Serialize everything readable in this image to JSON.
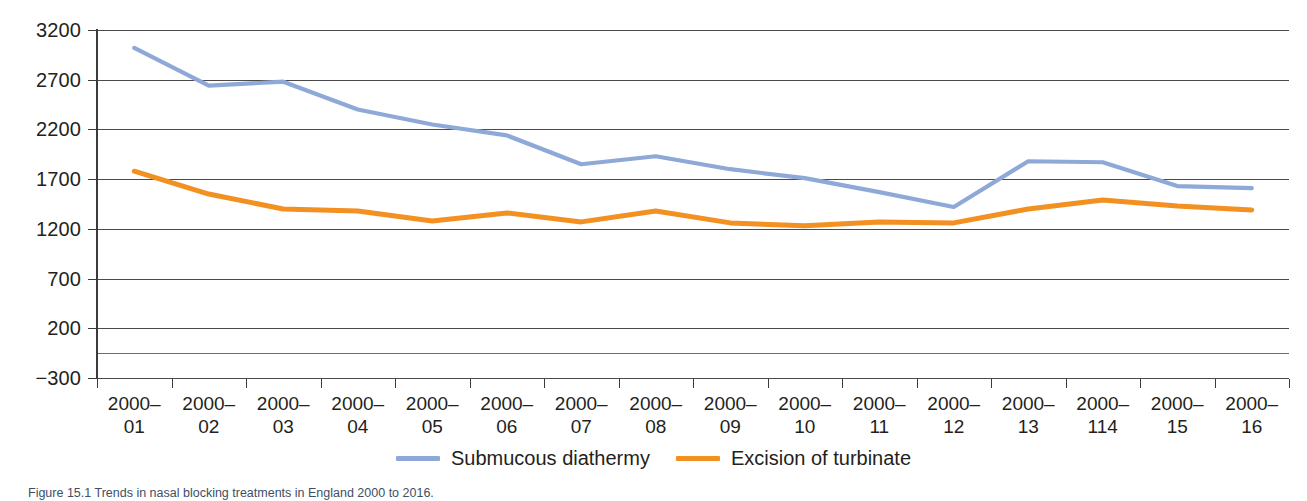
{
  "chart_data": {
    "type": "line",
    "title": "",
    "subtitle": "",
    "xlabel": "",
    "ylabel": "",
    "grid": true,
    "legend_position": "bottom-center",
    "ylim": [
      -300,
      3200
    ],
    "yticks": [
      3200,
      2700,
      2200,
      1700,
      1200,
      700,
      200,
      -300
    ],
    "ytick_labels": [
      "3200",
      "2700",
      "2200",
      "1700",
      "1200",
      "700",
      "200",
      "−300"
    ],
    "extra_gridlines": [
      -50
    ],
    "categories": [
      "2000–01",
      "2000–02",
      "2000–03",
      "2000–04",
      "2000–05",
      "2000–06",
      "2000–07",
      "2000–08",
      "2000–09",
      "2000–10",
      "2000–11",
      "2000–12",
      "2000–13",
      "2000–114",
      "2000–15",
      "2000–16"
    ],
    "category_lines": [
      [
        "2000–",
        "01"
      ],
      [
        "2000–",
        "02"
      ],
      [
        "2000–",
        "03"
      ],
      [
        "2000–",
        "04"
      ],
      [
        "2000–",
        "05"
      ],
      [
        "2000–",
        "06"
      ],
      [
        "2000–",
        "07"
      ],
      [
        "2000–",
        "08"
      ],
      [
        "2000–",
        "09"
      ],
      [
        "2000–",
        "10"
      ],
      [
        "2000–",
        "11"
      ],
      [
        "2000–",
        "12"
      ],
      [
        "2000–",
        "13"
      ],
      [
        "2000–",
        "114"
      ],
      [
        "2000–",
        "15"
      ],
      [
        "2000–",
        "16"
      ]
    ],
    "series": [
      {
        "name": "Submucous diathermy",
        "color": "#8EA9D8",
        "values": [
          3020,
          2640,
          2680,
          2400,
          2250,
          2140,
          1850,
          1930,
          1800,
          1710,
          1570,
          1420,
          1880,
          1870,
          1630,
          1610
        ]
      },
      {
        "name": "Excision of turbinate",
        "color": "#F29021",
        "values": [
          1780,
          1550,
          1400,
          1380,
          1280,
          1360,
          1270,
          1380,
          1260,
          1230,
          1270,
          1260,
          1400,
          1490,
          1430,
          1390
        ]
      }
    ]
  },
  "legend": {
    "entries": [
      {
        "label": "Submucous diathermy",
        "color": "#8EA9D8"
      },
      {
        "label": "Excision of turbinate",
        "color": "#F29021"
      }
    ]
  },
  "caption": {
    "text": "Figure 15.1 Trends in nasal blocking treatments in England 2000 to 2016."
  }
}
